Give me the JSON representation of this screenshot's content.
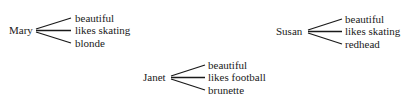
{
  "diagram": {
    "people": [
      {
        "name": "Mary",
        "attributes": [
          "beautiful",
          "likes skating",
          "blonde"
        ]
      },
      {
        "name": "Susan",
        "attributes": [
          "beautiful",
          "likes skating",
          "redhead"
        ]
      },
      {
        "name": "Janet",
        "attributes": [
          "beautiful",
          "likes football",
          "brunette"
        ]
      }
    ]
  }
}
